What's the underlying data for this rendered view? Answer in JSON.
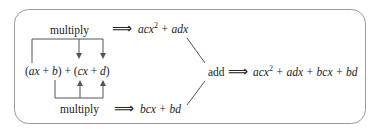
{
  "diagram": {
    "top_label": "multiply",
    "bottom_label": "multiply",
    "expression": {
      "open1": "(",
      "t1": "ax",
      "plus1": " + ",
      "t2": "b",
      "close1": ")",
      "plus_mid": " + ",
      "open2": "(",
      "t3": "cx",
      "plus2": " + ",
      "t4": "d",
      "close2": ")"
    },
    "implies": "⟹",
    "top_result": {
      "a": "acx",
      "exp": "2",
      "b": " + adx"
    },
    "bottom_result": "bcx + bd",
    "add_label": "add",
    "final_result": {
      "a": "acx",
      "exp": "2",
      "b": " + adx + bcx + bd"
    }
  },
  "colors": {
    "border": "#999999",
    "lines": "#555555",
    "text": "#222222"
  }
}
